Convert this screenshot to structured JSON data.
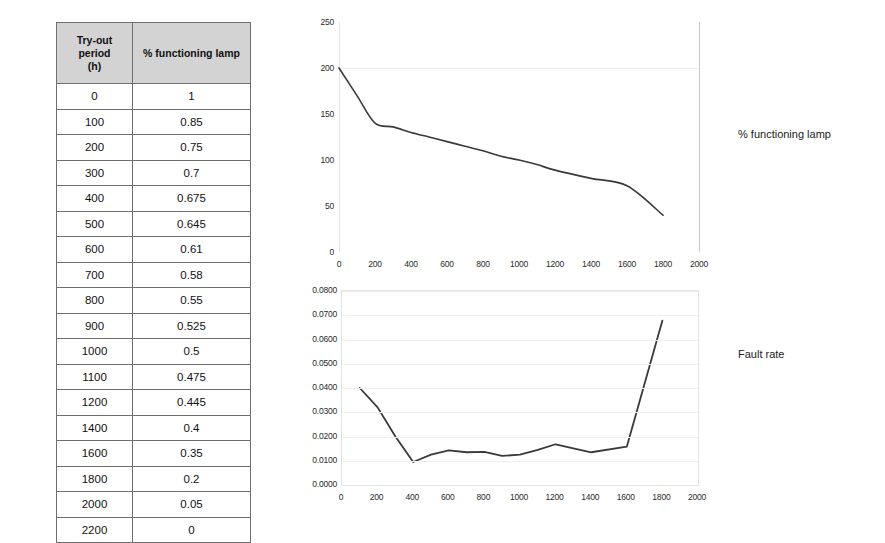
{
  "table": {
    "name": "lamp-reliability-table",
    "headers": [
      "Try-out period (h)",
      "% functioning lamp"
    ],
    "header_lines": [
      [
        "Try-out",
        "period",
        "(h)"
      ],
      [
        "% functioning lamp"
      ]
    ],
    "rows": [
      [
        "0",
        "1"
      ],
      [
        "100",
        "0.85"
      ],
      [
        "200",
        "0.75"
      ],
      [
        "300",
        "0.7"
      ],
      [
        "400",
        "0.675"
      ],
      [
        "500",
        "0.645"
      ],
      [
        "600",
        "0.61"
      ],
      [
        "700",
        "0.58"
      ],
      [
        "800",
        "0.55"
      ],
      [
        "900",
        "0.525"
      ],
      [
        "1000",
        "0.5"
      ],
      [
        "1100",
        "0.475"
      ],
      [
        "1200",
        "0.445"
      ],
      [
        "1400",
        "0.4"
      ],
      [
        "1600",
        "0.35"
      ],
      [
        "1800",
        "0.2"
      ],
      [
        "2000",
        "0.05"
      ],
      [
        "2200",
        "0"
      ]
    ]
  },
  "labels": {
    "chart1_side": "% functioning lamp",
    "chart2_side": "Fault rate"
  },
  "chart_data": [
    {
      "id": "functioning-lamp-chart",
      "type": "line",
      "title": "",
      "subtitle": "",
      "xlabel": "",
      "ylabel": "",
      "legend": [
        "% functioning lamp"
      ],
      "legend_position": "right-outside",
      "grid": true,
      "xlim": [
        0,
        2000
      ],
      "ylim": [
        0,
        250
      ],
      "xticks": [
        0,
        200,
        400,
        600,
        800,
        1000,
        1200,
        1400,
        1600,
        1800,
        2000
      ],
      "yticks": [
        0,
        50,
        100,
        150,
        200,
        250
      ],
      "xtick_labels": [
        "0",
        "200",
        "400",
        "600",
        "800",
        "1000",
        "1200",
        "1400",
        "1600",
        "1800",
        "2000"
      ],
      "ytick_labels": [
        "0",
        "50",
        "100",
        "150",
        "200",
        "250"
      ],
      "x": [
        0,
        100,
        200,
        300,
        400,
        500,
        600,
        700,
        800,
        900,
        1000,
        1100,
        1200,
        1400,
        1600,
        1800
      ],
      "values": [
        200,
        170,
        140,
        136,
        130,
        125,
        120,
        115,
        110,
        104,
        100,
        95,
        89,
        80,
        72,
        40
      ],
      "series_color": "#3a3a3a",
      "line_smooth": true,
      "markers": false
    },
    {
      "id": "fault-rate-chart",
      "type": "line",
      "title": "",
      "subtitle": "",
      "xlabel": "",
      "ylabel": "",
      "legend": [
        "Fault rate"
      ],
      "legend_position": "right-outside",
      "grid": true,
      "xlim": [
        0,
        2000
      ],
      "ylim": [
        0.0,
        0.08
      ],
      "xticks": [
        0,
        200,
        400,
        600,
        800,
        1000,
        1200,
        1400,
        1600,
        1800,
        2000
      ],
      "yticks": [
        0.0,
        0.01,
        0.02,
        0.03,
        0.04,
        0.05,
        0.06,
        0.07,
        0.08
      ],
      "xtick_labels": [
        "0",
        "200",
        "400",
        "600",
        "800",
        "1000",
        "1200",
        "1400",
        "1600",
        "1800",
        "2000"
      ],
      "ytick_labels": [
        "0.0000",
        "0.0100",
        "0.0200",
        "0.0300",
        "0.0400",
        "0.0500",
        "0.0600",
        "0.0700",
        "0.0800"
      ],
      "x": [
        100,
        200,
        300,
        400,
        500,
        600,
        700,
        800,
        900,
        1000,
        1100,
        1200,
        1400,
        1600,
        1800
      ],
      "values": [
        0.04,
        0.032,
        0.02,
        0.0095,
        0.0125,
        0.0143,
        0.0135,
        0.0137,
        0.012,
        0.0125,
        0.0145,
        0.0168,
        0.0135,
        0.0158,
        0.0678
      ],
      "series_color": "#3a3a3a",
      "line_smooth": false,
      "markers": false
    }
  ]
}
